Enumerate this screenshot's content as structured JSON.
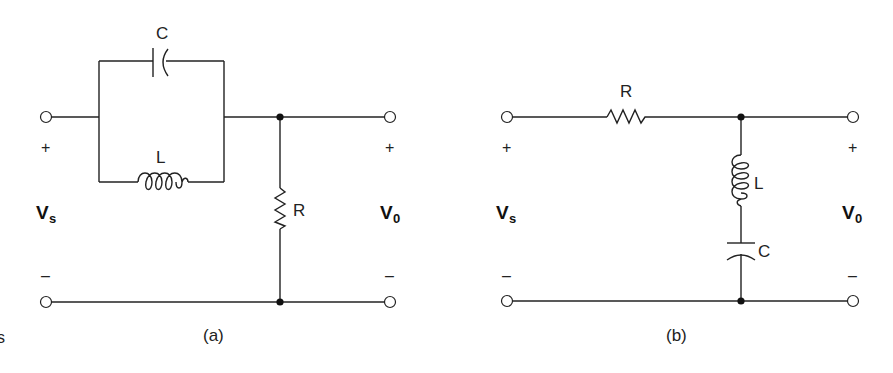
{
  "diagram": {
    "type": "circuit-schematics",
    "panels": [
      {
        "id": "a",
        "caption": "(a)",
        "description": "Parallel LC in series between input and output, resistor R shunt to ground across output",
        "components": {
          "capacitor": "C",
          "inductor": "L",
          "resistor": "R"
        },
        "input": {
          "label": "V",
          "subscript": "s",
          "plus": "+",
          "minus": "–"
        },
        "output": {
          "label": "V",
          "subscript": "0",
          "plus": "+",
          "minus": "–"
        }
      },
      {
        "id": "b",
        "caption": "(b)",
        "description": "Series resistor R from input to output, series LC branch shunt to ground across output",
        "components": {
          "resistor": "R",
          "inductor": "L",
          "capacitor": "C"
        },
        "input": {
          "label": "V",
          "subscript": "s",
          "plus": "+",
          "minus": "–"
        },
        "output": {
          "label": "V",
          "subscript": "0",
          "plus": "+",
          "minus": "–"
        }
      }
    ]
  },
  "stray_mark": "s"
}
